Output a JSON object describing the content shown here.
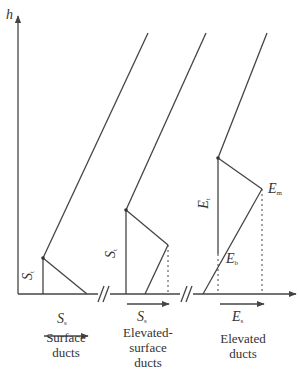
{
  "axis": {
    "y_label": "h"
  },
  "panels": [
    {
      "id": "surface",
      "caption_lines": [
        "Surface",
        "ducts"
      ],
      "thickness_label": "S",
      "thickness_sub": "t",
      "width_label": "S",
      "width_sub": "s"
    },
    {
      "id": "elevated-surface",
      "caption_lines": [
        "Elevated-",
        "surface",
        "ducts"
      ],
      "thickness_label": "S",
      "thickness_sub": "t",
      "width_label": "S",
      "width_sub": "s"
    },
    {
      "id": "elevated",
      "caption_lines": [
        "Elevated",
        "ducts"
      ],
      "thickness_label": "E",
      "thickness_sub": "t",
      "top_point_label": "E",
      "top_point_sub": "m",
      "bottom_point_label": "E",
      "bottom_point_sub": "b",
      "width_label": "E",
      "width_sub": "s"
    }
  ],
  "break_mark": "//",
  "colors": {
    "line": "#444444",
    "background": "#ffffff"
  }
}
